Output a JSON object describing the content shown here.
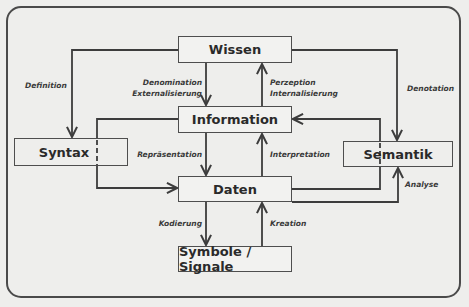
{
  "diagram": {
    "nodes": {
      "wissen": "Wissen",
      "information": "Information",
      "daten": "Daten",
      "symbole": "Symbole / Signale",
      "syntax": "Syntax",
      "semantik": "Semantik"
    },
    "edges": {
      "definition": "Definition",
      "denomination_line1": "Denomination",
      "denomination_line2": "Externalisierung",
      "perzeption_line1": "Perzeption",
      "perzeption_line2": "Internalisierung",
      "denotation": "Denotation",
      "repraesentation": "Repräsentation",
      "interpretation": "Interpretation",
      "analyse": "Analyse",
      "kodierung": "Kodierung",
      "kreation": "Kreation"
    },
    "colors": {
      "background": "#eeeeec",
      "line": "#3c3c3c",
      "text": "#2a2a2a"
    }
  }
}
